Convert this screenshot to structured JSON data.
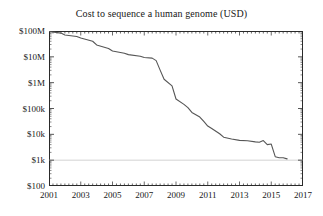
{
  "chart_data": {
    "type": "line",
    "title": "Cost to sequence a human genome (USD)",
    "xlabel": "",
    "ylabel": "",
    "yscale": "log",
    "ylim": [
      100,
      100000000
    ],
    "xlim": [
      2001,
      2017
    ],
    "grid": false,
    "legend": null,
    "y_ticks": [
      {
        "value": 100000000,
        "label": "$100M"
      },
      {
        "value": 10000000,
        "label": "$10M"
      },
      {
        "value": 1000000,
        "label": "$1M"
      },
      {
        "value": 100000,
        "label": "$100k"
      },
      {
        "value": 10000,
        "label": "$10k"
      },
      {
        "value": 1000,
        "label": "$1k"
      },
      {
        "value": 100,
        "label": "$100"
      }
    ],
    "x_ticks": [
      {
        "value": 2001,
        "label": "2001"
      },
      {
        "value": 2003,
        "label": "2003"
      },
      {
        "value": 2005,
        "label": "2005"
      },
      {
        "value": 2007,
        "label": "2007"
      },
      {
        "value": 2009,
        "label": "2009"
      },
      {
        "value": 2011,
        "label": "2011"
      },
      {
        "value": 2013,
        "label": "2013"
      },
      {
        "value": 2015,
        "label": "2015"
      },
      {
        "value": 2017,
        "label": "2017"
      }
    ],
    "x_minor_tick_interval": 0.25,
    "reference_line": {
      "value": 1000,
      "label": "$1k",
      "color": "#c8c8c8",
      "style": "solid-faint"
    },
    "series": [
      {
        "name": "Cost per genome",
        "color": "#555555",
        "width": 1.1,
        "x": [
          2001.0,
          2001.75,
          2002.0,
          2002.75,
          2003.0,
          2003.75,
          2004.0,
          2004.75,
          2005.0,
          2005.75,
          2006.0,
          2006.75,
          2007.0,
          2007.5,
          2007.75,
          2008.0,
          2008.25,
          2008.75,
          2009.0,
          2009.5,
          2009.75,
          2010.0,
          2010.5,
          2010.75,
          2011.0,
          2011.25,
          2011.75,
          2012.0,
          2012.5,
          2013.0,
          2013.5,
          2014.0,
          2014.25,
          2014.5,
          2014.75,
          2015.0,
          2015.25,
          2015.5,
          2015.75,
          2016.0
        ],
        "y": [
          95263072,
          83000000,
          70000000,
          61448422,
          53751684,
          40157554,
          28780376,
          20935000,
          16712371,
          13801124,
          12156065,
          10474556,
          9408739,
          8927342,
          7147571,
          3063820,
          1352982,
          752080,
          232735,
          144932,
          108065,
          70333,
          46774,
          31512,
          20963,
          16712,
          10497,
          7743,
          6618,
          5826,
          5671,
          5096,
          4920,
          5731,
          4008,
          4211,
          1363,
          1245,
          1245,
          1121
        ]
      }
    ]
  },
  "axis": {
    "title": "Cost to sequence a human genome (USD)"
  }
}
